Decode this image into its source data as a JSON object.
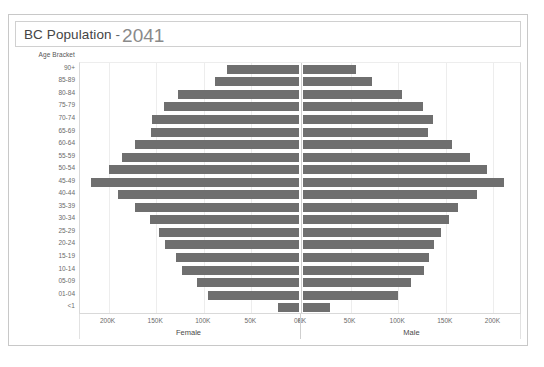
{
  "title": {
    "main": "BC Population",
    "separator": "-",
    "year": "2041"
  },
  "axis_header": "Age Bracket",
  "panels": {
    "left_label": "Female",
    "right_label": "Male"
  },
  "xticks_left": [
    "200K",
    "150K",
    "100K",
    "50K",
    "0K"
  ],
  "xticks_right": [
    "0K",
    "50K",
    "100K",
    "150K",
    "200K"
  ],
  "chart_data": {
    "type": "bar",
    "subtype": "population-pyramid",
    "title": "BC Population - 2041",
    "xlabel": "",
    "ylabel": "Age Bracket",
    "grid": true,
    "legend": "none",
    "left_panel_name": "Female",
    "right_panel_name": "Male",
    "xlim_left": [
      0,
      230000
    ],
    "xlim_right": [
      0,
      230000
    ],
    "xtick_values": [
      0,
      50000,
      100000,
      150000,
      200000
    ],
    "xtick_labels": [
      "0K",
      "50K",
      "100K",
      "150K",
      "200K"
    ],
    "categories": [
      "90+",
      "85-89",
      "80-84",
      "75-79",
      "70-74",
      "65-69",
      "60-64",
      "55-59",
      "50-54",
      "45-49",
      "40-44",
      "35-39",
      "30-34",
      "25-29",
      "20-24",
      "15-19",
      "10-14",
      "05-09",
      "01-04",
      "<1"
    ],
    "series": [
      {
        "name": "Female",
        "direction": "left",
        "values": [
          76000,
          88000,
          127000,
          142000,
          154000,
          155000,
          172000,
          186000,
          200000,
          218000,
          190000,
          172000,
          156000,
          147000,
          141000,
          129000,
          123000,
          107000,
          96000,
          22000
        ]
      },
      {
        "name": "Male",
        "direction": "right",
        "values": [
          56000,
          72000,
          104000,
          126000,
          137000,
          131000,
          156000,
          175000,
          193000,
          211000,
          183000,
          163000,
          153000,
          145000,
          138000,
          132000,
          127000,
          113000,
          100000,
          28000
        ]
      }
    ],
    "colors": {
      "bar": "#6f6f6f",
      "grid": "#ededed",
      "axis": "#d9d9d9",
      "text": "#6a6a6a"
    }
  }
}
